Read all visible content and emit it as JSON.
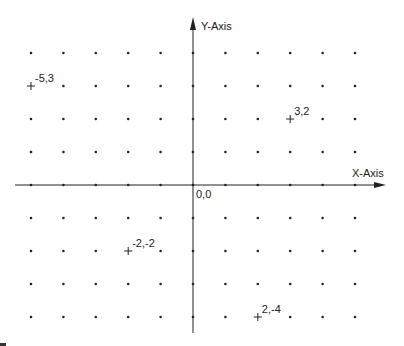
{
  "diagram": {
    "type": "cartesian-plane",
    "axes": {
      "x_label": "X-Axis",
      "y_label": "Y-Axis",
      "origin_label": "0,0"
    },
    "grid": {
      "x_range": [
        -5,
        5
      ],
      "y_range": [
        -4,
        4
      ],
      "dots": true
    },
    "points": [
      {
        "x": -5,
        "y": 3,
        "label": "-5,3"
      },
      {
        "x": 3,
        "y": 2,
        "label": "3,2"
      },
      {
        "x": -2,
        "y": -2,
        "label": "-2,-2"
      },
      {
        "x": 2,
        "y": -4,
        "label": "2,-4"
      }
    ],
    "colors": {
      "axis": "#222222",
      "dot": "#222222",
      "background": "#ffffff"
    }
  }
}
